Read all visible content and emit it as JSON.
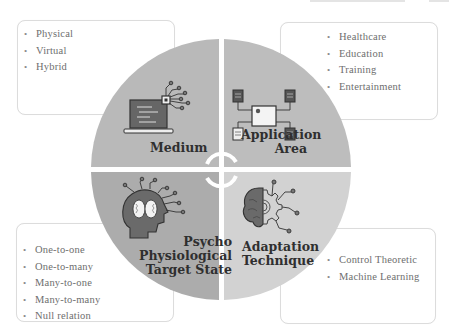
{
  "diagram": {
    "type": "quadrant-circle",
    "center_icon": "cycle-arrows-icon",
    "colors": {
      "medium_quadrant": "#b9b9b9",
      "application_quadrant": "#bdbdbd",
      "psycho_quadrant": "#acacac",
      "adaptation_quadrant": "#d2d2d2",
      "icon_dark": "#5a5a5a",
      "label_text": "#2f2f2f",
      "box_text": "#6e6e6e"
    },
    "quadrants": [
      {
        "id": "medium",
        "label_lines": [
          "Medium"
        ],
        "icon": "laptop-circuit-icon",
        "items": [
          "Physical",
          "Virtual",
          "Hybrid"
        ]
      },
      {
        "id": "application",
        "label_lines": [
          "Application",
          "Area"
        ],
        "icon": "network-chip-icon",
        "items": [
          "Healthcare",
          "Education",
          "Training",
          "Entertainment"
        ]
      },
      {
        "id": "psycho",
        "label_lines": [
          "Psycho",
          "Physiological",
          "Target State"
        ],
        "icon": "head-brain-circuit-icon",
        "items": [
          "One-to-one",
          "One-to-many",
          "Many-to-one",
          "Many-to-many",
          "Null relation"
        ]
      },
      {
        "id": "adaptation",
        "label_lines": [
          "Adaptation",
          "Technique"
        ],
        "icon": "brain-gear-icon",
        "items": [
          "Control Theoretic",
          "Machine Learning"
        ]
      }
    ]
  },
  "bullet": "•"
}
